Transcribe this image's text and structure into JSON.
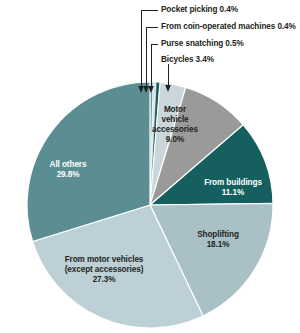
{
  "chart_data": {
    "type": "pie",
    "title": "",
    "subtitle": "",
    "xlabel": "",
    "ylabel": "",
    "legend_position": "none",
    "grid": false,
    "start_angle_deg": 0,
    "direction": "clockwise",
    "categories": [
      "Pocket picking",
      "From coin-operated machines",
      "Purse snatching",
      "Bicycles",
      "Motor vehicle accessories",
      "From buildings",
      "Shoplifting",
      "From motor vehicles (except accessories)",
      "All others"
    ],
    "values": [
      0.4,
      0.4,
      0.5,
      3.4,
      9.0,
      11.1,
      18.1,
      27.3,
      29.8
    ],
    "value_labels": [
      "0.4%",
      "0.4%",
      "0.5%",
      "3.4%",
      "9.0%",
      "11.1%",
      "18.1%",
      "27.3%",
      "29.8%"
    ],
    "colors": [
      "#6f9a9d",
      "#d8e4e8",
      "#16605f",
      "#c9d6da",
      "#9a9a9a",
      "#15605f",
      "#a8c0c6",
      "#bcd0d6",
      "#5a8e92"
    ],
    "slices": [
      {
        "label": "Pocket picking",
        "value": 0.4,
        "value_label": "0.4%",
        "color": "#6f9a9d",
        "label_placement": "callout"
      },
      {
        "label": "From coin-operated machines",
        "value": 0.4,
        "value_label": "0.4%",
        "color": "#d8e4e8",
        "label_placement": "callout"
      },
      {
        "label": "Purse snatching",
        "value": 0.5,
        "value_label": "0.5%",
        "color": "#16605f",
        "label_placement": "callout"
      },
      {
        "label": "Bicycles",
        "value": 3.4,
        "value_label": "3.4%",
        "color": "#c9d6da",
        "label_placement": "callout-arrow"
      },
      {
        "label": "Motor vehicle accessories",
        "value": 9.0,
        "value_label": "9.0%",
        "color": "#9a9a9a",
        "label_placement": "inside"
      },
      {
        "label": "From buildings",
        "value": 11.1,
        "value_label": "11.1%",
        "color": "#15605f",
        "label_placement": "inside"
      },
      {
        "label": "Shoplifting",
        "value": 18.1,
        "value_label": "18.1%",
        "color": "#a8c0c6",
        "label_placement": "inside"
      },
      {
        "label": "From motor vehicles (except accessories)",
        "value": 27.3,
        "value_label": "27.3%",
        "color": "#bcd0d6",
        "label_placement": "inside"
      },
      {
        "label": "All others",
        "value": 29.8,
        "value_label": "29.8%",
        "color": "#5a8e92",
        "label_placement": "inside"
      }
    ]
  },
  "callouts": {
    "pocket_picking": "Pocket picking 0.4%",
    "coin_operated": "From coin-operated machines 0.4%",
    "purse_snatching": "Purse snatching 0.5%",
    "bicycles": "Bicycles 3.4%"
  },
  "wedge_labels": {
    "motor_vehicle_accessories_l1": "Motor",
    "motor_vehicle_accessories_l2": "vehicle",
    "motor_vehicle_accessories_l3": "accessories",
    "motor_vehicle_accessories_pct": "9.0%",
    "from_buildings_l1": "From buildings",
    "from_buildings_pct": "11.1%",
    "shoplifting_l1": "Shoplifting",
    "shoplifting_pct": "18.1%",
    "from_motor_vehicles_l1": "From motor vehicles",
    "from_motor_vehicles_l2": "(except accessories)",
    "from_motor_vehicles_pct": "27.3%",
    "all_others_l1": "All others",
    "all_others_pct": "29.8%"
  }
}
